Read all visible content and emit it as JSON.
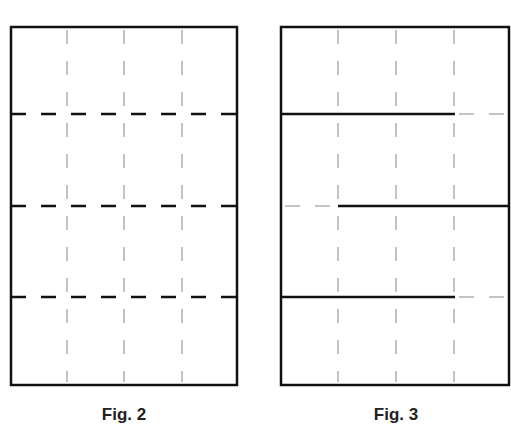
{
  "figures": [
    {
      "caption": "Fig. 2",
      "box": {
        "x": 11,
        "y": 27,
        "w": 226,
        "h": 358
      },
      "vertical_guides": [
        67,
        124,
        182
      ],
      "horizontal_lines": [
        {
          "y": 114,
          "x1": 11,
          "x2": 237,
          "style": "dashed"
        },
        {
          "y": 206,
          "x1": 11,
          "x2": 237,
          "style": "dashed"
        },
        {
          "y": 297,
          "x1": 11,
          "x2": 237,
          "style": "dashed"
        }
      ]
    },
    {
      "caption": "Fig. 3",
      "box": {
        "x": 281,
        "y": 27,
        "w": 228,
        "h": 358
      },
      "vertical_guides": [
        338,
        396,
        454
      ],
      "horizontal_lines": [
        {
          "y": 114,
          "x1": 281,
          "x2": 455,
          "style": "solid",
          "extension": {
            "x1": 455,
            "x2": 509
          }
        },
        {
          "y": 206,
          "x1": 338,
          "x2": 509,
          "style": "solid",
          "extension": {
            "x1": 281,
            "x2": 338
          }
        },
        {
          "y": 297,
          "x1": 281,
          "x2": 455,
          "style": "solid",
          "extension": {
            "x1": 455,
            "x2": 509
          }
        }
      ]
    }
  ],
  "colors": {
    "line": "#111111",
    "guide": "#b0b0b0"
  }
}
